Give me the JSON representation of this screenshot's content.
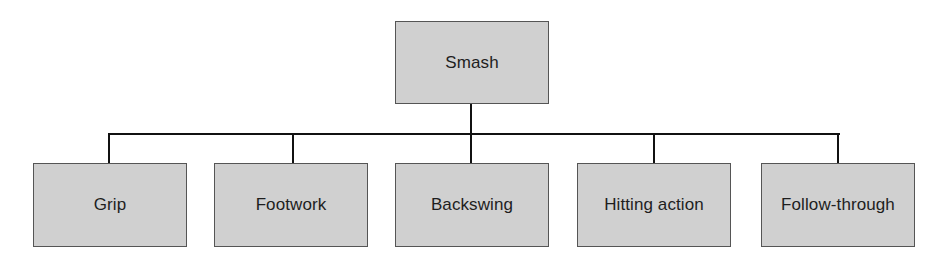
{
  "diagram": {
    "type": "hierarchy-tree",
    "root": {
      "label": "Smash"
    },
    "children": [
      {
        "label": "Grip"
      },
      {
        "label": "Footwork"
      },
      {
        "label": "Backswing"
      },
      {
        "label": "Hitting action"
      },
      {
        "label": "Follow-through"
      }
    ],
    "colors": {
      "node_fill": "#d0d0d0",
      "node_border": "#555555",
      "connector": "#111111",
      "text": "#1e1e1e"
    }
  }
}
